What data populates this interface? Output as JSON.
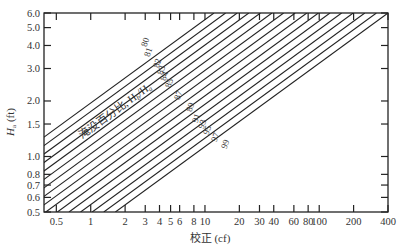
{
  "chart_data": {
    "type": "line",
    "title": "",
    "xlabel": "校正 (cf)",
    "ylabel": "Hₐ (ft)",
    "ylabel_main": "H",
    "ylabel_sub": "a",
    "ylabel_unit": " (ft)",
    "xscale": "log",
    "yscale": "log",
    "xlim": [
      0.39,
      400
    ],
    "ylim": [
      0.5,
      6.0
    ],
    "x_ticks": [
      0.5,
      1,
      2,
      3,
      4,
      5,
      6,
      8,
      10,
      20,
      30,
      40,
      60,
      80,
      100,
      200,
      400
    ],
    "x_tick_labels": [
      "0.5",
      "1",
      "2",
      "3",
      "4",
      "5",
      "6",
      "8",
      "10",
      "20",
      "30",
      "40",
      "60",
      "80",
      "100",
      "200",
      "400"
    ],
    "y_ticks": [
      0.5,
      0.6,
      0.7,
      0.8,
      1.0,
      1.5,
      2.0,
      3.0,
      4.0,
      5.0,
      6.0
    ],
    "y_tick_labels": [
      "0.5",
      "0.6",
      "0.7",
      "0.8",
      "1.0",
      "1.5",
      "2.0",
      "3.0",
      "4.0",
      "5.0",
      "6.0"
    ],
    "grid": false,
    "legend": "none",
    "annotation": "淹没百分比, Hb/Ha",
    "annotation_main": "淹没百分比, H",
    "annotation_sub1": "b",
    "annotation_slash": "/H",
    "annotation_sub2": "a",
    "series_labels": [
      "80",
      "81",
      "82",
      "83",
      "84",
      "85",
      "87",
      "89",
      "91",
      "93",
      "95",
      "97",
      "99"
    ],
    "series_note": "Family of parallel straight lines on log-log axes; each line is a submergence percentage. Line 80 passes approx (0.39, 1.5) and (4.5, 6.0); line 99 ends at (400, 6.0).",
    "line_count_drawn": 16
  }
}
